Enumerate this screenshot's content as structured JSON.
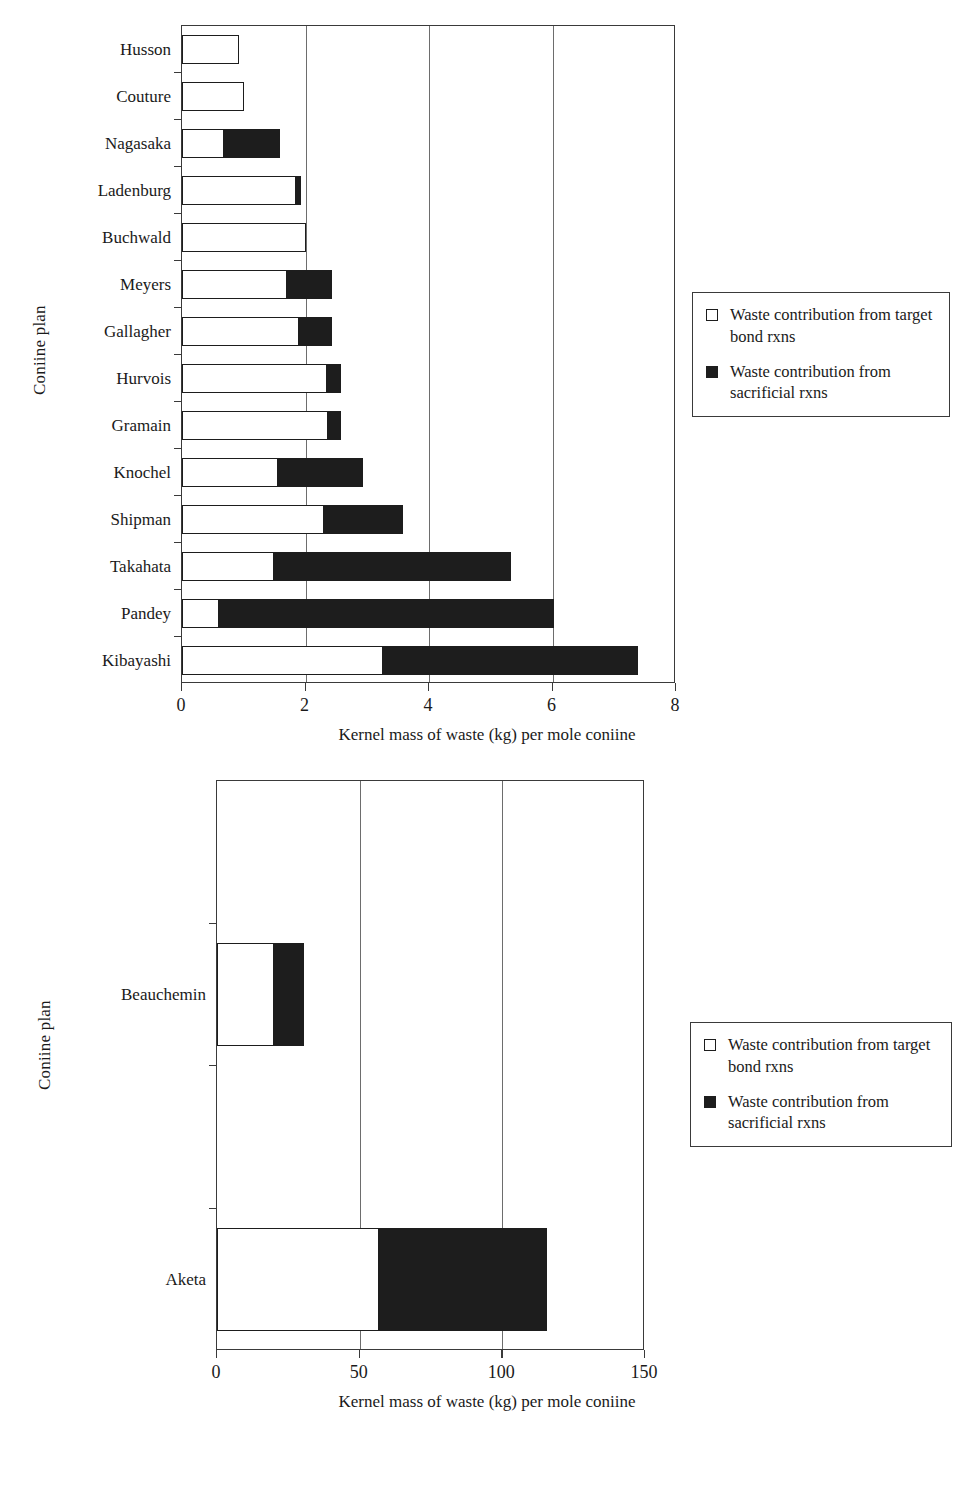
{
  "chart_data": [
    {
      "type": "bar",
      "orientation": "horizontal",
      "stacked": true,
      "title": "",
      "xlabel": "Kernel mass of waste (kg) per mole coniine",
      "ylabel": "Coniine plan",
      "xlim": [
        0,
        8
      ],
      "xticks": [
        0,
        2,
        4,
        6,
        8
      ],
      "xtick_labels": [
        "0",
        "2",
        "4",
        "6",
        "8"
      ],
      "grid": "vertical",
      "legend_position": "right",
      "categories": [
        "Husson",
        "Couture",
        "Nagasaka",
        "Ladenburg",
        "Buchwald",
        "Meyers",
        "Gallagher",
        "Hurvois",
        "Gramain",
        "Knochel",
        "Shipman",
        "Takahata",
        "Pandey",
        "Kibayashi"
      ],
      "series": [
        {
          "name": "Waste contribution from target bond rxns",
          "color": "#ffffff",
          "values": [
            0.92,
            1.0,
            0.68,
            1.85,
            2.0,
            1.7,
            1.9,
            2.35,
            2.37,
            1.55,
            2.3,
            1.5,
            0.6,
            3.25
          ]
        },
        {
          "name": "Waste contribution from sacrificial rxns",
          "color": "#1d1d1d",
          "values": [
            0.0,
            0.0,
            0.92,
            0.1,
            0.0,
            0.75,
            0.55,
            0.25,
            0.23,
            1.4,
            1.3,
            3.85,
            5.45,
            4.15
          ]
        }
      ],
      "totals": [
        0.92,
        1.0,
        1.6,
        1.95,
        2.0,
        2.45,
        2.45,
        2.6,
        2.6,
        2.95,
        3.6,
        5.35,
        6.05,
        7.4
      ]
    },
    {
      "type": "bar",
      "orientation": "horizontal",
      "stacked": true,
      "title": "",
      "xlabel": "Kernel mass of waste (kg) per mole coniine",
      "ylabel": "Coniine plan",
      "xlim": [
        0,
        150
      ],
      "xticks": [
        0,
        50,
        100,
        150
      ],
      "xtick_labels": [
        "0",
        "50",
        "100",
        "150"
      ],
      "grid": "vertical",
      "legend_position": "right",
      "categories": [
        "",
        "Beauchemin",
        "",
        "Aketa"
      ],
      "series": [
        {
          "name": "Waste contribution from target bond rxns",
          "color": "#ffffff",
          "values": [
            null,
            20,
            null,
            57
          ]
        },
        {
          "name": "Waste contribution from sacrificial rxns",
          "color": "#1d1d1d",
          "values": [
            null,
            11,
            null,
            59
          ]
        }
      ],
      "totals": [
        null,
        31,
        null,
        116
      ]
    }
  ],
  "top_chart": {
    "ylabel": "Coniine plan",
    "xlabel": "Kernel mass of waste (kg) per mole coniine",
    "xtick_labels": [
      "0",
      "2",
      "4",
      "6",
      "8"
    ],
    "categories": [
      "Husson",
      "Couture",
      "Nagasaka",
      "Ladenburg",
      "Buchwald",
      "Meyers",
      "Gallagher",
      "Hurvois",
      "Gramain",
      "Knochel",
      "Shipman",
      "Takahata",
      "Pandey",
      "Kibayashi"
    ],
    "legend": {
      "items": [
        {
          "label": "Waste contribution from target bond rxns",
          "swatch": "white"
        },
        {
          "label": "Waste contribution from sacrificial rxns",
          "swatch": "black"
        }
      ]
    }
  },
  "bottom_chart": {
    "ylabel": "Coniine plan",
    "xlabel": "Kernel mass of waste (kg) per mole coniine",
    "xtick_labels": [
      "0",
      "50",
      "100",
      "150"
    ],
    "categories": [
      "",
      "Beauchemin",
      "",
      "Aketa"
    ],
    "legend": {
      "items": [
        {
          "label": "Waste contribution from target bond rxns",
          "swatch": "white"
        },
        {
          "label": "Waste contribution from sacrificial rxns",
          "swatch": "black"
        }
      ]
    }
  },
  "colors": {
    "target_bond": "#ffffff",
    "sacrificial": "#1d1d1d",
    "axis": "#3a3a3a",
    "grid": "#6d6d6d"
  }
}
